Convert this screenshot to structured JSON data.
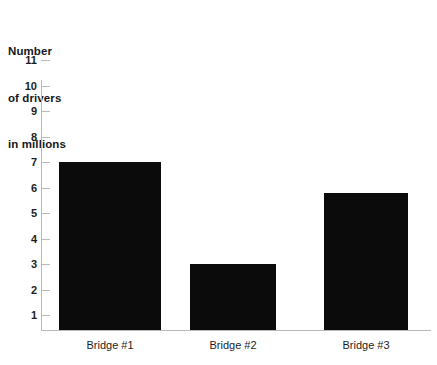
{
  "chart_data": {
    "type": "bar",
    "title": "Number of drivers in millions",
    "title_lines": [
      "Number",
      "of drivers",
      "in millions"
    ],
    "categories": [
      "Bridge #1",
      "Bridge #2",
      "Bridge #3"
    ],
    "values": [
      7,
      3,
      5.8
    ],
    "xlabel": "",
    "ylabel": "Number of drivers in millions",
    "ylim": [
      0,
      11
    ],
    "y_ticks": [
      11,
      10,
      9,
      8,
      7,
      6,
      5,
      4,
      3,
      2,
      1
    ],
    "grid": false,
    "legend": null,
    "bar_color": "#0b0b0b",
    "axis_color": "#b9b9b9",
    "background_color": "#ffffff",
    "text_color": "#1b1d22"
  }
}
